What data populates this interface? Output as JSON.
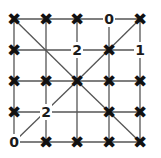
{
  "puzzle": {
    "type": "slant-grid",
    "rows": 5,
    "cols": 5,
    "grid_x": [
      14,
      46,
      77,
      109,
      140
    ],
    "grid_y": [
      19,
      50,
      81,
      112,
      142
    ],
    "line_color": "#555555",
    "mark_color": "#111111",
    "nodes": [
      [
        "X",
        "X",
        "X",
        "0",
        "X"
      ],
      [
        "X",
        "",
        "2",
        "X",
        "1"
      ],
      [
        "X",
        "X",
        "X",
        "X",
        "X"
      ],
      [
        "X",
        "2",
        "",
        "X",
        "X"
      ],
      [
        "0",
        "X",
        "X",
        "X",
        "X"
      ]
    ],
    "diagonals": [
      [
        [
          0,
          0
        ],
        [
          2,
          2
        ]
      ],
      [
        [
          0,
          4
        ],
        [
          2,
          2
        ]
      ],
      [
        [
          2,
          2
        ],
        [
          4,
          4
        ]
      ],
      [
        [
          2,
          2
        ],
        [
          4,
          0
        ]
      ]
    ]
  }
}
